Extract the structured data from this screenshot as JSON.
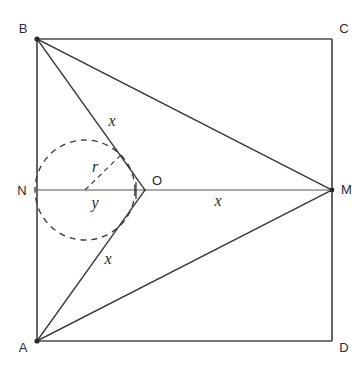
{
  "figure": {
    "type": "geometry-diagram",
    "background_color": "#ffffff",
    "line_color": "#3a3a3a",
    "label_color": "#2b2b2b"
  },
  "vertices": [
    {
      "id": "B",
      "label": "B",
      "x": 37,
      "y": 39,
      "label_x": 23,
      "label_y": 33,
      "dot": true
    },
    {
      "id": "C",
      "label": "C",
      "x": 332,
      "y": 39,
      "label_x": 344,
      "label_y": 33,
      "dot": false
    },
    {
      "id": "A",
      "label": "A",
      "x": 37,
      "y": 341,
      "label_x": 23,
      "label_y": 352,
      "dot": true
    },
    {
      "id": "D",
      "label": "D",
      "x": 332,
      "y": 341,
      "label_x": 344,
      "label_y": 352,
      "dot": false
    },
    {
      "id": "N",
      "label": "N",
      "x": 37,
      "y": 190,
      "label_x": 22,
      "label_y": 195,
      "dot": false
    },
    {
      "id": "M",
      "label": "M",
      "x": 332,
      "y": 190,
      "label_x": 341,
      "label_y": 194,
      "dot": true
    },
    {
      "id": "O",
      "label": "O",
      "x": 145,
      "y": 190,
      "label_x": 152,
      "label_y": 185,
      "dot": false
    }
  ],
  "measures": [
    {
      "id": "x-upper",
      "label": "x",
      "x": 112,
      "y": 126
    },
    {
      "id": "x-lower",
      "label": "x",
      "x": 108,
      "y": 264
    },
    {
      "id": "x-right",
      "label": "x",
      "x": 218,
      "y": 206
    },
    {
      "id": "r-radius",
      "label": "r",
      "x": 95,
      "y": 172
    },
    {
      "id": "y-segment",
      "label": "y",
      "x": 95,
      "y": 208
    }
  ],
  "circle": {
    "center_x": 85,
    "center_y": 190,
    "radius": 50,
    "style": "dashed"
  },
  "radius_line": {
    "from_x": 85,
    "from_y": 190,
    "to_x": 121,
    "to_y": 155
  },
  "tick_mark": {
    "x": 136,
    "y_top": 182,
    "y_bottom": 199
  },
  "segments": [
    {
      "id": "side-BC",
      "from": "B",
      "to": "C",
      "style": "frame"
    },
    {
      "id": "side-AD",
      "from": "A",
      "to": "D",
      "style": "frame"
    },
    {
      "id": "side-AB",
      "from": "A",
      "to": "B",
      "style": "frame"
    },
    {
      "id": "side-CD",
      "from": "C",
      "to": "D",
      "style": "frame"
    },
    {
      "id": "axis-NM",
      "from": "N",
      "to": "M",
      "style": "axis"
    },
    {
      "id": "segment-BO",
      "from": "B",
      "to": "O",
      "style": "solid"
    },
    {
      "id": "segment-AO",
      "from": "A",
      "to": "O",
      "style": "solid"
    },
    {
      "id": "segment-BM",
      "from": "B",
      "to": "M",
      "style": "solid"
    },
    {
      "id": "segment-AM",
      "from": "A",
      "to": "M",
      "style": "solid"
    }
  ]
}
